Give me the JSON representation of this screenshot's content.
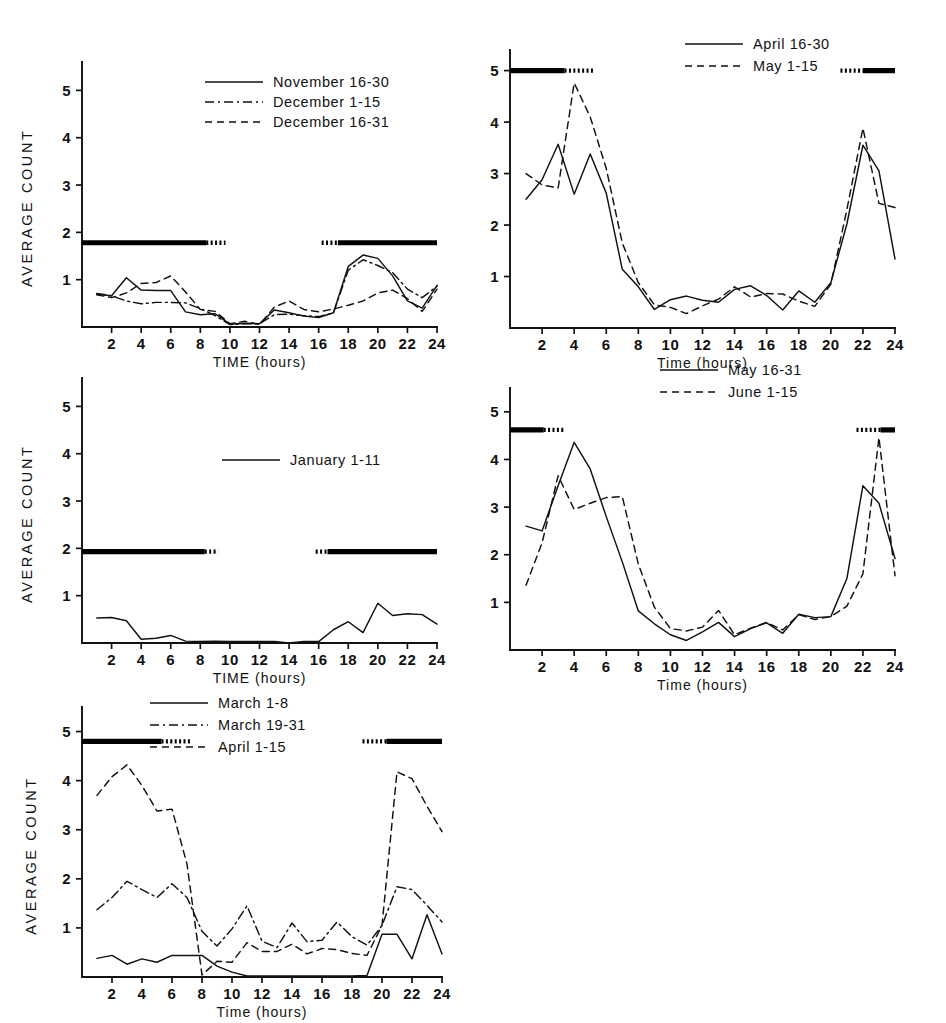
{
  "figure": {
    "background_color": "#ffffff",
    "line_color": "#111111",
    "panel_count": 5
  },
  "chart_data": [
    {
      "id": "panel-nov-dec",
      "type": "line",
      "title": "",
      "xlabel": "TIME  (hours)",
      "ylabel": "AVERAGE  COUNT",
      "xlim": [
        0,
        24
      ],
      "ylim": [
        0,
        5.6
      ],
      "xticks": [
        2,
        4,
        6,
        8,
        10,
        12,
        14,
        16,
        18,
        20,
        22,
        24
      ],
      "yticks": [
        1,
        2,
        3,
        4,
        5
      ],
      "grid": false,
      "legend_position": "top-center-right",
      "dark_bar_level": 1.78,
      "dark_periods": [
        {
          "from": 0.0,
          "to": 8.4,
          "style": "solid"
        },
        {
          "from": 8.4,
          "to": 9.7,
          "style": "dotted"
        },
        {
          "from": 16.2,
          "to": 17.3,
          "style": "dotted"
        },
        {
          "from": 17.3,
          "to": 24.0,
          "style": "solid"
        }
      ],
      "x": [
        1,
        2,
        3,
        4,
        5,
        6,
        7,
        8,
        9,
        10,
        11,
        12,
        13,
        14,
        15,
        16,
        17,
        18,
        19,
        20,
        21,
        22,
        23,
        24
      ],
      "series": [
        {
          "name": "November 16-30",
          "style": "solid",
          "values": [
            0.69,
            0.66,
            1.04,
            0.78,
            0.77,
            0.77,
            0.32,
            0.26,
            0.28,
            0.06,
            0.08,
            0.07,
            0.36,
            0.3,
            0.23,
            0.2,
            0.3,
            1.28,
            1.52,
            1.45,
            1.08,
            0.55,
            0.4,
            0.88
          ]
        },
        {
          "name": "December 1-15",
          "style": "dashdot",
          "values": [
            0.71,
            0.66,
            0.55,
            0.49,
            0.52,
            0.52,
            0.51,
            0.39,
            0.24,
            0.05,
            0.07,
            0.07,
            0.26,
            0.27,
            0.24,
            0.22,
            0.3,
            1.2,
            1.42,
            1.3,
            1.15,
            0.8,
            0.62,
            0.86
          ]
        },
        {
          "name": "December 16-31",
          "style": "dashed",
          "values": [
            0.68,
            0.62,
            0.72,
            0.92,
            0.94,
            1.08,
            0.74,
            0.37,
            0.33,
            0.07,
            0.12,
            0.05,
            0.42,
            0.55,
            0.37,
            0.32,
            0.38,
            0.46,
            0.55,
            0.72,
            0.78,
            0.6,
            0.33,
            0.8
          ]
        }
      ]
    },
    {
      "id": "panel-apr-may",
      "type": "line",
      "title": "",
      "xlabel": "Time (hours)",
      "ylabel": "",
      "xlim": [
        0,
        24
      ],
      "ylim": [
        0,
        5.4
      ],
      "xticks": [
        2,
        4,
        6,
        8,
        10,
        12,
        14,
        16,
        18,
        20,
        22,
        24
      ],
      "yticks": [
        1,
        2,
        3,
        4,
        5
      ],
      "grid": false,
      "legend_position": "top-right",
      "dark_bar_level": 5.0,
      "dark_periods": [
        {
          "from": 0.0,
          "to": 3.4,
          "style": "solid"
        },
        {
          "from": 3.4,
          "to": 5.3,
          "style": "dotted"
        },
        {
          "from": 20.6,
          "to": 22.0,
          "style": "dotted"
        },
        {
          "from": 22.0,
          "to": 24.0,
          "style": "solid"
        }
      ],
      "x": [
        1,
        2,
        3,
        4,
        5,
        6,
        7,
        8,
        9,
        10,
        11,
        12,
        13,
        14,
        15,
        16,
        17,
        18,
        19,
        20,
        21,
        22,
        23,
        24
      ],
      "series": [
        {
          "name": "April 16-30",
          "style": "solid",
          "values": [
            2.5,
            2.88,
            3.57,
            2.6,
            3.38,
            2.62,
            1.14,
            0.8,
            0.36,
            0.55,
            0.62,
            0.54,
            0.5,
            0.75,
            0.82,
            0.63,
            0.35,
            0.72,
            0.5,
            0.88,
            2.02,
            3.55,
            3.05,
            1.34
          ]
        },
        {
          "name": "May 1-15",
          "style": "dashed",
          "values": [
            3.0,
            2.78,
            2.72,
            4.76,
            4.1,
            3.1,
            1.65,
            0.88,
            0.45,
            0.4,
            0.28,
            0.43,
            0.56,
            0.8,
            0.6,
            0.67,
            0.66,
            0.52,
            0.42,
            0.85,
            2.3,
            3.88,
            2.42,
            2.34
          ]
        }
      ]
    },
    {
      "id": "panel-january",
      "type": "line",
      "title": "",
      "xlabel": "TIME (hours)",
      "ylabel": "AVERAGE  COUNT",
      "xlim": [
        0,
        24
      ],
      "ylim": [
        0,
        5.6
      ],
      "xticks": [
        2,
        4,
        6,
        8,
        10,
        12,
        14,
        16,
        18,
        20,
        22,
        24
      ],
      "yticks": [
        1,
        2,
        3,
        4,
        5
      ],
      "grid": false,
      "legend_position": "center-right",
      "dark_bar_level": 1.93,
      "dark_periods": [
        {
          "from": 0.0,
          "to": 8.3,
          "style": "solid"
        },
        {
          "from": 8.3,
          "to": 9.2,
          "style": "dotted"
        },
        {
          "from": 15.8,
          "to": 16.6,
          "style": "dotted"
        },
        {
          "from": 16.6,
          "to": 24.0,
          "style": "solid"
        }
      ],
      "x": [
        1,
        2,
        3,
        4,
        5,
        6,
        7,
        8,
        9,
        10,
        11,
        12,
        13,
        14,
        15,
        16,
        17,
        18,
        19,
        20,
        21,
        22,
        23,
        24
      ],
      "series": [
        {
          "name": "January 1-11",
          "style": "solid",
          "values": [
            0.53,
            0.54,
            0.47,
            0.08,
            0.1,
            0.16,
            0.04,
            0.03,
            0.04,
            0.03,
            0.03,
            0.03,
            0.03,
            0.0,
            0.03,
            0.03,
            0.28,
            0.45,
            0.22,
            0.84,
            0.58,
            0.62,
            0.6,
            0.4
          ]
        }
      ]
    },
    {
      "id": "panel-may-june",
      "type": "line",
      "title": "",
      "xlabel": "Time (hours)",
      "ylabel": "",
      "xlim": [
        0,
        24
      ],
      "ylim": [
        0,
        5.5
      ],
      "xticks": [
        2,
        4,
        6,
        8,
        10,
        12,
        14,
        16,
        18,
        20,
        22,
        24
      ],
      "yticks": [
        1,
        2,
        3,
        4,
        5
      ],
      "grid": false,
      "legend_position": "top-center-right",
      "dark_bar_level": 4.62,
      "dark_periods": [
        {
          "from": 0.0,
          "to": 2.1,
          "style": "solid"
        },
        {
          "from": 2.1,
          "to": 3.4,
          "style": "dotted"
        },
        {
          "from": 21.6,
          "to": 23.1,
          "style": "dotted"
        },
        {
          "from": 23.1,
          "to": 24.0,
          "style": "solid"
        }
      ],
      "x": [
        1,
        2,
        3,
        4,
        5,
        6,
        7,
        8,
        9,
        10,
        11,
        12,
        13,
        14,
        15,
        16,
        17,
        18,
        19,
        20,
        21,
        22,
        23,
        24
      ],
      "series": [
        {
          "name": "May 16-31",
          "style": "solid",
          "values": [
            2.6,
            2.5,
            3.45,
            4.36,
            3.8,
            2.8,
            1.85,
            0.82,
            0.55,
            0.32,
            0.2,
            0.38,
            0.58,
            0.28,
            0.45,
            0.57,
            0.35,
            0.75,
            0.68,
            0.7,
            1.5,
            3.45,
            3.08,
            1.92
          ]
        },
        {
          "name": "June 1-15",
          "style": "dashed",
          "values": [
            1.36,
            2.25,
            3.66,
            2.95,
            3.08,
            3.2,
            3.22,
            1.8,
            0.9,
            0.45,
            0.4,
            0.48,
            0.83,
            0.32,
            0.46,
            0.58,
            0.42,
            0.74,
            0.64,
            0.7,
            0.92,
            1.6,
            4.46,
            1.56
          ]
        }
      ]
    },
    {
      "id": "panel-march-april",
      "type": "line",
      "title": "",
      "xlabel": "Time (hours)",
      "ylabel": "AVERAGE COUNT",
      "xlim": [
        0,
        24
      ],
      "ylim": [
        0,
        5.5
      ],
      "xticks": [
        2,
        4,
        6,
        8,
        10,
        12,
        14,
        16,
        18,
        20,
        22,
        24
      ],
      "yticks": [
        1,
        2,
        3,
        4,
        5
      ],
      "grid": false,
      "legend_position": "top-center",
      "dark_bar_level": 4.8,
      "dark_periods": [
        {
          "from": 0.0,
          "to": 5.3,
          "style": "solid"
        },
        {
          "from": 5.3,
          "to": 7.2,
          "style": "dotted"
        },
        {
          "from": 18.7,
          "to": 20.3,
          "style": "dotted"
        },
        {
          "from": 20.3,
          "to": 24.0,
          "style": "solid"
        }
      ],
      "x": [
        1,
        2,
        3,
        4,
        5,
        6,
        7,
        8,
        9,
        10,
        11,
        12,
        13,
        14,
        15,
        16,
        17,
        18,
        19,
        20,
        21,
        22,
        23,
        24
      ],
      "series": [
        {
          "name": "March 1-8",
          "style": "solid",
          "values": [
            0.38,
            0.44,
            0.26,
            0.37,
            0.3,
            0.44,
            0.44,
            0.44,
            0.22,
            0.1,
            0.02,
            0.02,
            0.02,
            0.02,
            0.02,
            0.02,
            0.02,
            0.02,
            0.03,
            0.87,
            0.87,
            0.37,
            1.27,
            0.47
          ]
        },
        {
          "name": "March 19-31",
          "style": "dashdot",
          "values": [
            1.37,
            1.62,
            1.95,
            1.78,
            1.62,
            1.9,
            1.62,
            0.93,
            0.63,
            0.98,
            1.45,
            0.73,
            0.6,
            1.1,
            0.72,
            0.75,
            1.12,
            0.82,
            0.65,
            1.05,
            1.84,
            1.78,
            1.46,
            1.12
          ]
        },
        {
          "name": "April 1-15",
          "style": "dashed",
          "values": [
            3.7,
            4.08,
            4.32,
            3.9,
            3.38,
            3.42,
            2.3,
            0.04,
            0.32,
            0.3,
            0.7,
            0.52,
            0.52,
            0.67,
            0.47,
            0.58,
            0.56,
            0.48,
            0.44,
            1.05,
            4.18,
            4.04,
            3.48,
            2.96
          ]
        }
      ]
    }
  ]
}
